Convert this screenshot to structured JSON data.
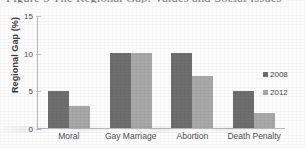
{
  "caption": "Figure 3   The Regional Gap: Values and Social Issues",
  "chart_data": {
    "type": "bar",
    "title": "Figure 3   The Regional Gap: Values and Social Issues",
    "xlabel": "",
    "ylabel": "Regional Gap (%)",
    "ylim": [
      0,
      15
    ],
    "yticks": [
      0,
      5,
      10,
      15
    ],
    "ytick_labels": [
      "0",
      "5",
      "10",
      "15"
    ],
    "grid": false,
    "legend_position": "right",
    "categories": [
      "Moral",
      "Gay Marriage",
      "Abortion",
      "Death Penalty"
    ],
    "series": [
      {
        "name": "2008",
        "color": "#6e6e6e",
        "values": [
          5,
          10,
          10,
          5
        ]
      },
      {
        "name": "2012",
        "color": "#a8a8a8",
        "values": [
          3,
          10,
          7,
          2
        ]
      }
    ]
  }
}
